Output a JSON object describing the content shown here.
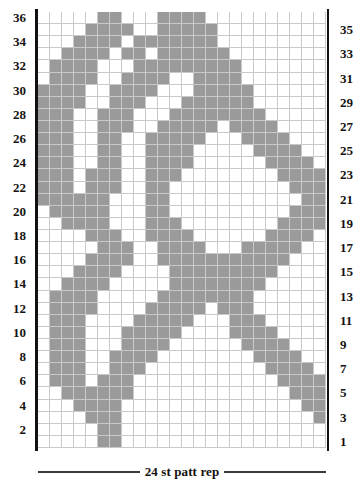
{
  "chart": {
    "type": "knitting-stitch-chart",
    "columns": 24,
    "rows": 36,
    "colors": {
      "filled": "#9a9a9a",
      "empty": "#ffffff",
      "gridline": "#c9c9c9",
      "rep_edge": "#111111",
      "text": "#15120f"
    },
    "left_row_labels": [
      "36",
      "34",
      "32",
      "30",
      "28",
      "26",
      "24",
      "22",
      "20",
      "18",
      "16",
      "14",
      "12",
      "10",
      "8",
      "6",
      "4",
      "2"
    ],
    "right_row_labels": [
      "35",
      "33",
      "31",
      "29",
      "27",
      "25",
      "23",
      "21",
      "19",
      "17",
      "15",
      "13",
      "11",
      "9",
      "7",
      "5",
      "3",
      "1"
    ],
    "footer": {
      "caption": "24 st patt rep"
    },
    "grid": [
      "000000000011101100111110000000000000000000000000",
      "000000001111110011011110000000000000000000000000",
      "000001111110001101111100000000000000000000000000",
      "000011111100011011111000000000000000000000000000",
      "011111110001101111011100000000000000000000000000",
      "011111100011011110011110000000000000000000000000",
      "011111000110111100111110000000000000000000000000",
      "111110001101111001111100000000000000000000000000",
      "111100011011110011111000000000000000000000000000",
      "111000110111100111110000000000000000000000000000",
      "110001101111001111100000000000000000000000000000",
      "100011011110011111000000000000000000000000000000",
      "000110111100111110000000000000000000000000000000",
      "001101111001111100000000000000000000000000000000",
      "011011110011111000000000000000000000000000000000",
      "110111100111110000000000000000000000000000000000",
      "101111001111100000000000000000000000000000000000",
      "011110011111000000000000000000000000000000000000",
      "111100111110000000000000000000000000000000000000",
      "111001111100000000000000000000000000000000000000",
      "110011111000000000000000000000000000000000000000",
      "100111110000000000000000000000000000000000000000",
      "001111100000000000000000000000000000000000000000",
      "011111000000000000000000000000000000000000000000",
      "111110000000000000000000000000000000000000000000",
      "111100000000000000000000000000000000000000000000",
      "111000000000000000000000000000000000000000000000",
      "110000000000000000000000000000000000000000000000",
      "100000000000000000000000000000000000000000000000",
      "000000000000000000000000000000000000000000000000",
      "000000000000000000000000000000000000000000000000",
      "000000000000000000000000000000000000000000000000",
      "000000000000000000000000000000000000000000000000",
      "000000000000000000000000000000000000000000000000",
      "000000000000000000000000000000000000000000000000",
      "000000000000000000000000000000000000000000000000"
    ],
    "grid_rows_top_to_bottom": [
      "000001100011110000000000",
      "000011110011111000000000",
      "000111101111111000000000",
      "001111011011111100000000",
      "011110001111111110000000",
      "011110011110011110000000",
      "111100111100011111000000",
      "111100111000111111000000",
      "111001110001111111100000",
      "111001110011111011110000",
      "111001100111110001111000",
      "111001100111100000111100",
      "111001100111100000011110",
      "111011100111000000001111",
      "111011100110000000000111",
      "111111000110000000000011",
      "011111000110000000000111",
      "001111000111000000001111",
      "000011100111100000011110",
      "000001110011110001111100",
      "000011110011111111111000",
      "000111100001111111110000",
      "001111000001111111100000",
      "011110000011111111000000",
      "011110000111110111000000",
      "011100001111100011100000",
      "011100011111000011110000",
      "011100011110000001111000",
      "011100111100000000111100",
      "011100111000000000011110",
      "011101110000000000001111",
      "001111110000000000000111",
      "000111100000000000000011",
      "000011100000000000000001",
      "000001100000000000000000",
      "000001100000000000000000"
    ]
  }
}
